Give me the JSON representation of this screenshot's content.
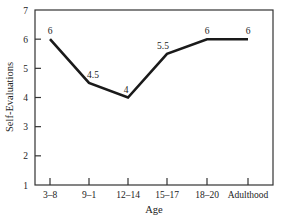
{
  "chart_data": {
    "type": "line",
    "title": "",
    "xlabel": "Age",
    "ylabel": "Self-Evaluations",
    "categories": [
      "3–8",
      "9–1",
      "12–14",
      "15–17",
      "18–20",
      "Adulthood"
    ],
    "series": [
      {
        "name": "Self-Evaluations",
        "values": [
          6,
          4.5,
          4,
          5.5,
          6,
          6
        ],
        "labels": [
          "6",
          "4.5",
          "4",
          "5.5",
          "6",
          "6"
        ]
      }
    ],
    "ylim": [
      1,
      7
    ],
    "yticks": [
      1,
      2,
      3,
      4,
      5,
      6,
      7
    ],
    "ytick_labels": [
      "1",
      "2",
      "3",
      "4",
      "5",
      "6",
      "7"
    ],
    "grid": false,
    "legend": "none",
    "line_color": "#1a1a1a"
  }
}
